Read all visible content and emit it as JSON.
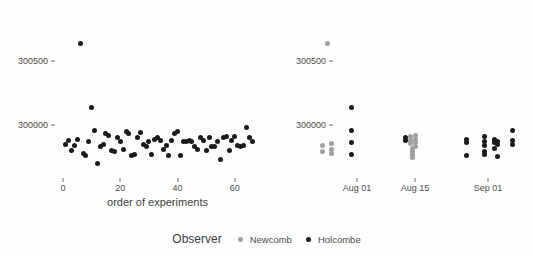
{
  "chart_data": {
    "type": "scatter",
    "title": "",
    "background": "#fdfdfd",
    "colors": {
      "newcomb": "#a0a0a0",
      "holcombe": "#1a1a1a"
    },
    "legend": {
      "title": "Observer",
      "position": "bottom",
      "entries": [
        {
          "name": "Newcomb",
          "color": "#a0a0a0"
        },
        {
          "name": "Holcombe",
          "color": "#1a1a1a"
        }
      ]
    },
    "panels": [
      {
        "id": "left",
        "xlabel": "order of experiments",
        "ylabel": "",
        "xlim": [
          -2,
          68
        ],
        "ylim": [
          299700,
          300800
        ],
        "grid": false,
        "xticks": [
          {
            "value": 0,
            "label": "0"
          },
          {
            "value": 20,
            "label": "20"
          },
          {
            "value": 40,
            "label": "40"
          },
          {
            "value": 60,
            "label": "60"
          }
        ],
        "yticks": [
          {
            "value": 300500,
            "label": "300500"
          },
          {
            "value": 300000,
            "label": "300000"
          }
        ],
        "points": [
          {
            "x": 1,
            "y": 299850,
            "series": "Holcombe"
          },
          {
            "x": 2,
            "y": 299880,
            "series": "Holcombe"
          },
          {
            "x": 3,
            "y": 299800,
            "series": "Holcombe"
          },
          {
            "x": 4,
            "y": 299840,
            "series": "Holcombe"
          },
          {
            "x": 5,
            "y": 299890,
            "series": "Holcombe"
          },
          {
            "x": 6,
            "y": 300640,
            "series": "Holcombe"
          },
          {
            "x": 7,
            "y": 299780,
            "series": "Holcombe"
          },
          {
            "x": 8,
            "y": 299760,
            "series": "Holcombe"
          },
          {
            "x": 9,
            "y": 299870,
            "series": "Holcombe"
          },
          {
            "x": 10,
            "y": 300140,
            "series": "Holcombe"
          },
          {
            "x": 11,
            "y": 299960,
            "series": "Holcombe"
          },
          {
            "x": 12,
            "y": 299700,
            "series": "Holcombe"
          },
          {
            "x": 13,
            "y": 299830,
            "series": "Holcombe"
          },
          {
            "x": 14,
            "y": 299850,
            "series": "Holcombe"
          },
          {
            "x": 15,
            "y": 299930,
            "series": "Holcombe"
          },
          {
            "x": 16,
            "y": 299920,
            "series": "Holcombe"
          },
          {
            "x": 17,
            "y": 299800,
            "series": "Holcombe"
          },
          {
            "x": 18,
            "y": 299790,
            "series": "Holcombe"
          },
          {
            "x": 19,
            "y": 299900,
            "series": "Holcombe"
          },
          {
            "x": 20,
            "y": 299870,
            "series": "Holcombe"
          },
          {
            "x": 21,
            "y": 299810,
            "series": "Holcombe"
          },
          {
            "x": 22,
            "y": 299950,
            "series": "Holcombe"
          },
          {
            "x": 23,
            "y": 299930,
            "series": "Holcombe"
          },
          {
            "x": 24,
            "y": 299760,
            "series": "Holcombe"
          },
          {
            "x": 25,
            "y": 299770,
            "series": "Holcombe"
          },
          {
            "x": 26,
            "y": 299900,
            "series": "Holcombe"
          },
          {
            "x": 27,
            "y": 299940,
            "series": "Holcombe"
          },
          {
            "x": 28,
            "y": 299850,
            "series": "Holcombe"
          },
          {
            "x": 29,
            "y": 299830,
            "series": "Holcombe"
          },
          {
            "x": 30,
            "y": 299870,
            "series": "Holcombe"
          },
          {
            "x": 31,
            "y": 299770,
            "series": "Holcombe"
          },
          {
            "x": 32,
            "y": 299890,
            "series": "Holcombe"
          },
          {
            "x": 33,
            "y": 299900,
            "series": "Holcombe"
          },
          {
            "x": 34,
            "y": 299880,
            "series": "Holcombe"
          },
          {
            "x": 35,
            "y": 299810,
            "series": "Holcombe"
          },
          {
            "x": 36,
            "y": 299840,
            "series": "Holcombe"
          },
          {
            "x": 37,
            "y": 299760,
            "series": "Holcombe"
          },
          {
            "x": 38,
            "y": 299880,
            "series": "Holcombe"
          },
          {
            "x": 39,
            "y": 299930,
            "series": "Holcombe"
          },
          {
            "x": 40,
            "y": 299950,
            "series": "Holcombe"
          },
          {
            "x": 41,
            "y": 299760,
            "series": "Holcombe"
          },
          {
            "x": 42,
            "y": 299870,
            "series": "Holcombe"
          },
          {
            "x": 43,
            "y": 299870,
            "series": "Holcombe"
          },
          {
            "x": 44,
            "y": 299880,
            "series": "Holcombe"
          },
          {
            "x": 45,
            "y": 299870,
            "series": "Holcombe"
          },
          {
            "x": 46,
            "y": 299830,
            "series": "Holcombe"
          },
          {
            "x": 47,
            "y": 299810,
            "series": "Holcombe"
          },
          {
            "x": 48,
            "y": 299900,
            "series": "Holcombe"
          },
          {
            "x": 49,
            "y": 299880,
            "series": "Holcombe"
          },
          {
            "x": 50,
            "y": 299800,
            "series": "Holcombe"
          },
          {
            "x": 51,
            "y": 299900,
            "series": "Holcombe"
          },
          {
            "x": 52,
            "y": 299830,
            "series": "Holcombe"
          },
          {
            "x": 53,
            "y": 299830,
            "series": "Holcombe"
          },
          {
            "x": 54,
            "y": 299870,
            "series": "Holcombe"
          },
          {
            "x": 55,
            "y": 299730,
            "series": "Holcombe"
          },
          {
            "x": 56,
            "y": 299900,
            "series": "Holcombe"
          },
          {
            "x": 57,
            "y": 299910,
            "series": "Holcombe"
          },
          {
            "x": 58,
            "y": 299800,
            "series": "Holcombe"
          },
          {
            "x": 59,
            "y": 299880,
            "series": "Holcombe"
          },
          {
            "x": 60,
            "y": 299910,
            "series": "Holcombe"
          },
          {
            "x": 61,
            "y": 299840,
            "series": "Holcombe"
          },
          {
            "x": 62,
            "y": 299830,
            "series": "Holcombe"
          },
          {
            "x": 63,
            "y": 299840,
            "series": "Holcombe"
          },
          {
            "x": 64,
            "y": 299980,
            "series": "Holcombe"
          },
          {
            "x": 65,
            "y": 299900,
            "series": "Holcombe"
          },
          {
            "x": 66,
            "y": 299870,
            "series": "Holcombe"
          }
        ]
      },
      {
        "id": "right",
        "xlabel": "",
        "ylabel": "",
        "ylim": [
          299700,
          300800
        ],
        "grid": false,
        "xticks": [
          {
            "px": 357,
            "label": "Aug 01"
          },
          {
            "px": 415,
            "label": "Aug 15"
          },
          {
            "px": 488,
            "label": "Sep 01"
          }
        ],
        "yticks": [
          {
            "value": 300500,
            "label": "300500"
          },
          {
            "value": 300000,
            "label": "300000"
          }
        ],
        "points": [
          {
            "px": 327,
            "y": 300640,
            "series": "Newcomb"
          },
          {
            "px": 322,
            "y": 299840,
            "series": "Newcomb"
          },
          {
            "px": 322,
            "y": 299790,
            "series": "Newcomb"
          },
          {
            "px": 331,
            "y": 299855,
            "series": "Newcomb"
          },
          {
            "px": 331,
            "y": 299810,
            "series": "Newcomb"
          },
          {
            "px": 331,
            "y": 299775,
            "series": "Newcomb"
          },
          {
            "px": 351,
            "y": 300140,
            "series": "Holcombe"
          },
          {
            "px": 351,
            "y": 299960,
            "series": "Holcombe"
          },
          {
            "px": 351,
            "y": 299860,
            "series": "Holcombe"
          },
          {
            "px": 351,
            "y": 299770,
            "series": "Holcombe"
          },
          {
            "px": 405,
            "y": 299900,
            "series": "Holcombe"
          },
          {
            "px": 405,
            "y": 299880,
            "series": "Holcombe"
          },
          {
            "px": 410,
            "y": 299910,
            "series": "Newcomb"
          },
          {
            "px": 410,
            "y": 299880,
            "series": "Newcomb"
          },
          {
            "px": 410,
            "y": 299855,
            "series": "Newcomb"
          },
          {
            "px": 415,
            "y": 299920,
            "series": "Newcomb"
          },
          {
            "px": 415,
            "y": 299890,
            "series": "Newcomb"
          },
          {
            "px": 415,
            "y": 299860,
            "series": "Newcomb"
          },
          {
            "px": 415,
            "y": 299830,
            "series": "Newcomb"
          },
          {
            "px": 412,
            "y": 299820,
            "series": "Newcomb"
          },
          {
            "px": 412,
            "y": 299795,
            "series": "Newcomb"
          },
          {
            "px": 412,
            "y": 299770,
            "series": "Newcomb"
          },
          {
            "px": 412,
            "y": 299750,
            "series": "Newcomb"
          },
          {
            "px": 466,
            "y": 299890,
            "series": "Holcombe"
          },
          {
            "px": 466,
            "y": 299860,
            "series": "Holcombe"
          },
          {
            "px": 466,
            "y": 299760,
            "series": "Holcombe"
          },
          {
            "px": 484,
            "y": 299910,
            "series": "Holcombe"
          },
          {
            "px": 484,
            "y": 299870,
            "series": "Holcombe"
          },
          {
            "px": 484,
            "y": 299840,
            "series": "Holcombe"
          },
          {
            "px": 484,
            "y": 299790,
            "series": "Holcombe"
          },
          {
            "px": 484,
            "y": 299770,
            "series": "Holcombe"
          },
          {
            "px": 494,
            "y": 299890,
            "series": "Holcombe"
          },
          {
            "px": 494,
            "y": 299870,
            "series": "Holcombe"
          },
          {
            "px": 494,
            "y": 299860,
            "series": "Holcombe"
          },
          {
            "px": 497,
            "y": 299875,
            "series": "Holcombe"
          },
          {
            "px": 497,
            "y": 299850,
            "series": "Holcombe"
          },
          {
            "px": 494,
            "y": 299820,
            "series": "Holcombe"
          },
          {
            "px": 497,
            "y": 299755,
            "series": "Holcombe"
          },
          {
            "px": 512,
            "y": 299960,
            "series": "Holcombe"
          },
          {
            "px": 512,
            "y": 299880,
            "series": "Holcombe"
          },
          {
            "px": 512,
            "y": 299850,
            "series": "Holcombe"
          }
        ]
      }
    ]
  }
}
